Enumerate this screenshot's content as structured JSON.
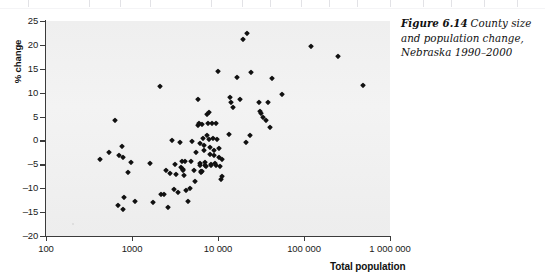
{
  "figure": {
    "caption_label": "Figure 6.14",
    "caption_text": "County size and population change, Nebraska 1990–2000"
  },
  "chart_data": {
    "type": "scatter",
    "title": "",
    "xlabel": "Total population",
    "ylabel": "% change",
    "xscale": "log",
    "yscale": "linear",
    "xlim": [
      100,
      1000000
    ],
    "ylim": [
      -20,
      25
    ],
    "grid": false,
    "legend": null,
    "marker_color": "#111111",
    "panel_color": "#f1f1f1",
    "x_ticks": [
      100,
      1000,
      10000,
      100000,
      1000000
    ],
    "x_tick_labels": [
      "100",
      "1000",
      "10 000",
      "100 000",
      "1 000 000"
    ],
    "y_ticks": [
      -20,
      -15,
      -10,
      -5,
      0,
      5,
      10,
      15,
      20,
      25
    ],
    "y_tick_labels": [
      "–20",
      "–15",
      "–10",
      "–5",
      "0",
      "5",
      "10",
      "15",
      "20",
      "25"
    ],
    "points": [
      [
        430,
        -3.9
      ],
      [
        545,
        -2.4
      ],
      [
        640,
        4.3
      ],
      [
        700,
        -3.0
      ],
      [
        690,
        -13.6
      ],
      [
        760,
        -1.2
      ],
      [
        780,
        -3.4
      ],
      [
        790,
        -14.3
      ],
      [
        800,
        -11.8
      ],
      [
        900,
        -6.5
      ],
      [
        980,
        -4.6
      ],
      [
        1080,
        -12.6
      ],
      [
        1600,
        -4.8
      ],
      [
        1750,
        -12.9
      ],
      [
        2100,
        11.3
      ],
      [
        2150,
        -11.3
      ],
      [
        2350,
        -11.2
      ],
      [
        2500,
        -6.2
      ],
      [
        2600,
        -13.9
      ],
      [
        2750,
        -6.9
      ],
      [
        2950,
        0.0
      ],
      [
        3050,
        -10.2
      ],
      [
        3150,
        -4.9
      ],
      [
        3250,
        -7.1
      ],
      [
        3400,
        -10.8
      ],
      [
        3600,
        -0.3
      ],
      [
        3700,
        -5.5
      ],
      [
        3850,
        -4.4
      ],
      [
        3900,
        -6.0
      ],
      [
        3950,
        -6.2
      ],
      [
        4050,
        -7.2
      ],
      [
        4150,
        -4.3
      ],
      [
        4300,
        -10.3
      ],
      [
        4500,
        -12.6
      ],
      [
        4700,
        -9.9
      ],
      [
        4800,
        -4.2
      ],
      [
        5000,
        -0.2
      ],
      [
        5200,
        -6.1
      ],
      [
        5400,
        -8.5
      ],
      [
        5600,
        -2.4
      ],
      [
        5800,
        8.6
      ],
      [
        5900,
        3.3
      ],
      [
        6000,
        3.6
      ],
      [
        6100,
        -0.6
      ],
      [
        6150,
        -4.8
      ],
      [
        6250,
        -5.2
      ],
      [
        6350,
        -6.4
      ],
      [
        6400,
        -6.6
      ],
      [
        6500,
        -6.3
      ],
      [
        6600,
        3.5
      ],
      [
        6700,
        0.6
      ],
      [
        6800,
        -1.0
      ],
      [
        6900,
        -2.1
      ],
      [
        7000,
        -4.6
      ],
      [
        7100,
        -5.1
      ],
      [
        7200,
        -5.4
      ],
      [
        7400,
        1.2
      ],
      [
        7500,
        5.6
      ],
      [
        7600,
        3.7
      ],
      [
        7800,
        6.0
      ],
      [
        7900,
        0.4
      ],
      [
        8000,
        -1.3
      ],
      [
        8100,
        -2.9
      ],
      [
        8200,
        -5.0
      ],
      [
        8300,
        -5.2
      ],
      [
        8500,
        3.6
      ],
      [
        8700,
        0.5
      ],
      [
        8900,
        -1.9
      ],
      [
        9000,
        -3.0
      ],
      [
        9200,
        -4.7
      ],
      [
        9400,
        -5.1
      ],
      [
        9600,
        3.6
      ],
      [
        9800,
        0.3
      ],
      [
        10000,
        14.5
      ],
      [
        10200,
        -1.6
      ],
      [
        10400,
        -3.5
      ],
      [
        10600,
        -5.3
      ],
      [
        10800,
        -8.1
      ],
      [
        11000,
        -3.8
      ],
      [
        11200,
        -7.5
      ],
      [
        13500,
        1.3
      ],
      [
        13800,
        9.1
      ],
      [
        14200,
        8.0
      ],
      [
        14800,
        7.0
      ],
      [
        16500,
        13.3
      ],
      [
        18000,
        8.6
      ],
      [
        19500,
        21.2
      ],
      [
        21000,
        -0.4
      ],
      [
        22000,
        22.4
      ],
      [
        23500,
        1.1
      ],
      [
        24500,
        14.3
      ],
      [
        30000,
        8.0
      ],
      [
        31000,
        6.2
      ],
      [
        32000,
        5.7
      ],
      [
        33500,
        5.0
      ],
      [
        36000,
        4.3
      ],
      [
        38000,
        8.1
      ],
      [
        40000,
        2.9
      ],
      [
        42000,
        13.1
      ],
      [
        56000,
        9.7
      ],
      [
        120000,
        19.8
      ],
      [
        250000,
        17.6
      ],
      [
        480000,
        11.6
      ]
    ]
  }
}
